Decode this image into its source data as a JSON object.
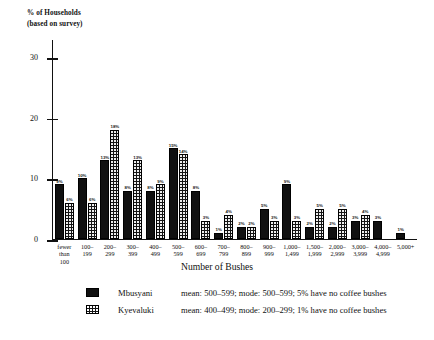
{
  "chart_data": {
    "type": "bar",
    "title": "",
    "xlabel": "Number of Bushes",
    "ylabel": "% of Households\n(based on survey)",
    "ylim": [
      0,
      33
    ],
    "yticks": [
      0,
      10,
      20,
      30
    ],
    "grid": false,
    "legend_position": "bottom",
    "categories": [
      "fewer\nthan\n100",
      "100–\n199",
      "200–\n299",
      "300–\n399",
      "400–\n499",
      "500–\n599",
      "600–\n699",
      "700–\n799",
      "800–\n899",
      "900–\n999",
      "1,000–\n1,499",
      "1,500–\n1,999",
      "2,000–\n2,999",
      "3,000–\n3,999",
      "4,000–\n4,999",
      "5,000+"
    ],
    "series": [
      {
        "name": "Mbusyani",
        "pattern": "solid",
        "values": [
          9,
          10,
          13,
          8,
          8,
          15,
          8,
          1,
          2,
          5,
          9,
          2,
          2,
          3,
          3,
          1
        ],
        "labels": [
          "9%",
          "10%",
          "13%",
          "8%",
          "8%",
          "15%",
          "8%",
          "1%",
          "2%",
          "5%",
          "9%",
          "2%",
          "2%",
          "3%",
          "3%",
          "1%"
        ]
      },
      {
        "name": "Kyevaluki",
        "pattern": "dotted",
        "values": [
          6,
          6,
          18,
          13,
          9,
          14,
          3,
          4,
          2,
          3,
          3,
          5,
          5,
          4,
          0,
          0
        ],
        "labels": [
          "6%",
          "6%",
          "18%",
          "13%",
          "9%",
          "14%",
          "3%",
          "4%",
          "2%",
          "3%",
          "3%",
          "5%",
          "5%",
          "4%",
          "",
          ""
        ]
      }
    ]
  },
  "legend": {
    "entries": [
      {
        "name": "Mbusyani",
        "description": "mean: 500–599; mode: 500–599; 5% have no coffee bushes",
        "pattern": "solid"
      },
      {
        "name": "Kyevaluki",
        "description": "mean: 400–499; mode: 200–299; 1% have no coffee bushes",
        "pattern": "dotted"
      }
    ]
  }
}
